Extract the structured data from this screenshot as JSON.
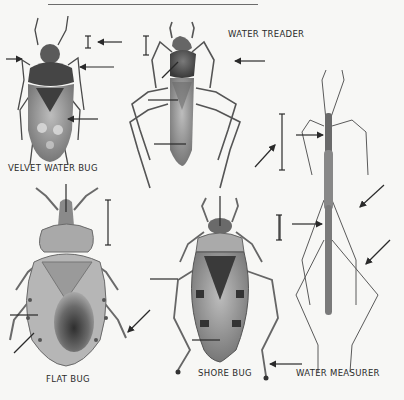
{
  "page": {
    "background": "#f7f7f5",
    "ink": "#2a2a2a"
  },
  "labels": {
    "velvet_water_bug": "VELVET WATER BUG",
    "water_treader": "WATER TREADER",
    "flat_bug": "FLAT BUG",
    "shore_bug": "SHORE BUG",
    "water_measurer": "WATER MEASURER"
  },
  "figures": [
    {
      "name": "velvet-water-bug",
      "label_key": "velvet_water_bug",
      "has_scale_bar": true,
      "pointer_arrows": 4
    },
    {
      "name": "water-treader",
      "label_key": "water_treader",
      "has_scale_bar": true,
      "pointer_arrows": 4
    },
    {
      "name": "water-measurer",
      "label_key": "water_measurer",
      "has_scale_bar": true,
      "pointer_arrows": 4
    },
    {
      "name": "flat-bug",
      "label_key": "flat_bug",
      "has_scale_bar": true,
      "pointer_arrows": 3
    },
    {
      "name": "shore-bug",
      "label_key": "shore_bug",
      "has_scale_bar": true,
      "pointer_arrows": 3
    }
  ]
}
